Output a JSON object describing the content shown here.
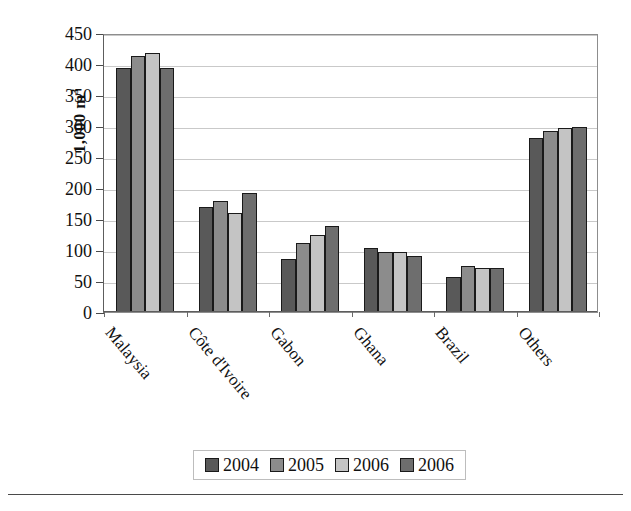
{
  "chart_data": {
    "type": "bar",
    "title": "",
    "xlabel": "",
    "ylabel": "1,000 m",
    "ylabel_superscript": "3",
    "categories": [
      "Malaysia",
      "Côte d'Ivoire",
      "Gabon",
      "Ghana",
      "Brazil",
      "Others"
    ],
    "series": [
      {
        "name": "2004",
        "color": "#595959",
        "values": [
          393,
          170,
          85,
          103,
          57,
          281
        ]
      },
      {
        "name": "2005",
        "color": "#8c8c8c",
        "values": [
          413,
          179,
          112,
          97,
          75,
          292
        ]
      },
      {
        "name": "2006",
        "color": "#c4c4c4",
        "values": [
          418,
          160,
          125,
          96,
          71,
          297
        ]
      },
      {
        "name": "2006",
        "color": "#6e6e6e",
        "values": [
          393,
          192,
          139,
          90,
          71,
          299
        ]
      }
    ],
    "ylim": [
      0,
      450
    ],
    "yticks": [
      0,
      50,
      100,
      150,
      200,
      250,
      300,
      350,
      400,
      450
    ],
    "ytick_labels": [
      "0",
      "50",
      "100",
      "150",
      "200",
      "250",
      "300",
      "350",
      "400",
      "450"
    ],
    "grid": true,
    "grid_axis": "y",
    "legend_position": "bottom",
    "category_label_rotation": -50
  },
  "legend": {
    "items": [
      {
        "label": "2004",
        "color": "#595959"
      },
      {
        "label": "2005",
        "color": "#8c8c8c"
      },
      {
        "label": "2006",
        "color": "#c4c4c4"
      },
      {
        "label": "2006",
        "color": "#6e6e6e"
      }
    ]
  }
}
